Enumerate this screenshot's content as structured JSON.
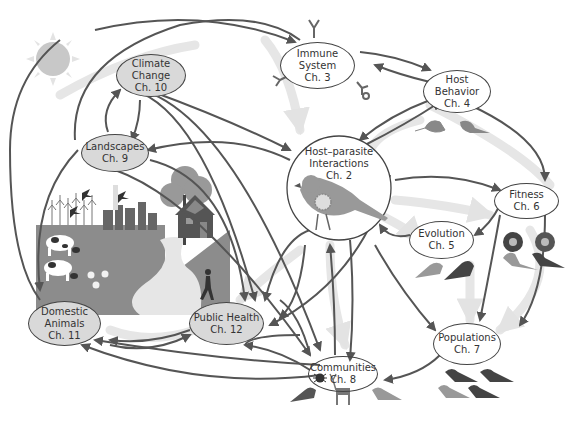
{
  "diagram": {
    "type": "concept-map",
    "nodes": [
      {
        "id": "hostparasite",
        "lines": [
          "Host–parasite",
          "Interactions",
          "Ch. 2"
        ],
        "chapter": 2
      },
      {
        "id": "immune",
        "lines": [
          "Immune",
          "System",
          "Ch. 3"
        ],
        "chapter": 3
      },
      {
        "id": "behavior",
        "lines": [
          "Host",
          "Behavior",
          "Ch. 4"
        ],
        "chapter": 4
      },
      {
        "id": "evolution",
        "lines": [
          "Evolution",
          "Ch. 5"
        ],
        "chapter": 5
      },
      {
        "id": "fitness",
        "lines": [
          "Fitness",
          "Ch. 6"
        ],
        "chapter": 6
      },
      {
        "id": "populations",
        "lines": [
          "Populations",
          "Ch. 7"
        ],
        "chapter": 7
      },
      {
        "id": "communities",
        "lines": [
          "Communities",
          "Ch. 8"
        ],
        "chapter": 8
      },
      {
        "id": "landscapes",
        "lines": [
          "Landscapes",
          "Ch. 9"
        ],
        "chapter": 9
      },
      {
        "id": "climate",
        "lines": [
          "Climate",
          "Change",
          "Ch. 10"
        ],
        "chapter": 10
      },
      {
        "id": "domestic",
        "lines": [
          "Domestic",
          "Animals",
          "Ch. 11"
        ],
        "chapter": 11
      },
      {
        "id": "publichealth",
        "lines": [
          "Public Health",
          "Ch. 12"
        ],
        "chapter": 12
      }
    ],
    "icons": [
      "sun-icon",
      "antibody-icon",
      "bird-icon",
      "nest-icon",
      "tick-icon",
      "deer-icon",
      "cow-icon",
      "chicken-icon",
      "city-skyline-icon",
      "house-icon",
      "tree-icon",
      "runner-icon",
      "cornfield-icon",
      "swallow-icon"
    ],
    "colors": {
      "node_fill": "#d9d9d9",
      "node_border": "#444444",
      "arrow_dark": "#555555",
      "arrow_light": "#e3e3e3",
      "landscape_ground": "#8c8c8c",
      "path": "#e6e6e6",
      "sun": "#c8c8c8"
    }
  }
}
